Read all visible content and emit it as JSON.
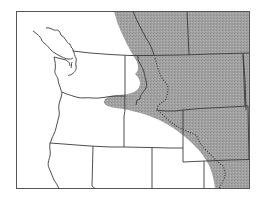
{
  "map": {
    "type": "species-range-map",
    "region": "Pacific Northwest, western North America",
    "colors": {
      "background": "#ffffff",
      "range_fill": "#a0a0a0",
      "line": "#3a3a3a",
      "frame": "#555555"
    },
    "legend": {
      "shaded_area": "range",
      "dotted_line": "continental divide / boundary"
    }
  }
}
